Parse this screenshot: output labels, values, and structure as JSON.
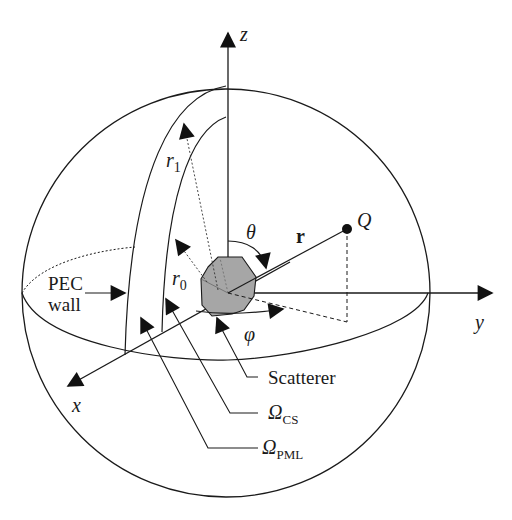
{
  "figure": {
    "colors": {
      "line": "#1a1a1a",
      "scatterer_fill": "#a6a6a6",
      "background": "#ffffff"
    }
  },
  "axes": {
    "x": "x",
    "y": "y",
    "z": "z"
  },
  "symbols": {
    "theta": "θ",
    "phi": "φ",
    "r_vector": "r",
    "point": "Q",
    "r0": {
      "base": "r",
      "sub": "0"
    },
    "r1": {
      "base": "r",
      "sub": "1"
    }
  },
  "callouts": {
    "pec_wall_line1": "PEC",
    "pec_wall_line2": "wall",
    "scatterer": "Scatterer",
    "omega_cs": {
      "base": "Ω",
      "sub": "CS"
    },
    "omega_pml": {
      "base": "Ω",
      "sub": "PML"
    }
  }
}
